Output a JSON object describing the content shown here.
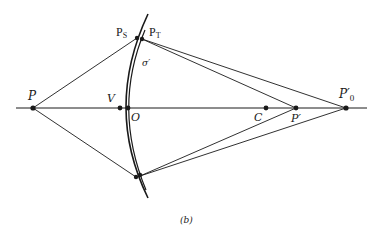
{
  "figure": {
    "caption": "(b)",
    "colors": {
      "ink": "#1a1a1a",
      "background": "#ffffff"
    }
  },
  "labels": {
    "P": "P",
    "V": "V",
    "O": "O",
    "C": "C",
    "P_prime": "P′",
    "P_prime_0_main": "P′",
    "P_prime_0_sub": "0",
    "P_S_main": "P",
    "P_S_sub": "S",
    "P_T_main": "P",
    "P_T_sub": "T",
    "sigma_prime": "σ′"
  },
  "points": {
    "P": [
      33,
      108
    ],
    "V": [
      120,
      108
    ],
    "O": [
      128,
      108
    ],
    "C": [
      266,
      108
    ],
    "P_prime": [
      296,
      108
    ],
    "P_prime_0": [
      346,
      108
    ],
    "P_S": [
      137,
      38
    ],
    "P_T": [
      142,
      39
    ],
    "P_S_lower": [
      136,
      177
    ],
    "P_T_lower": [
      141,
      175
    ]
  }
}
